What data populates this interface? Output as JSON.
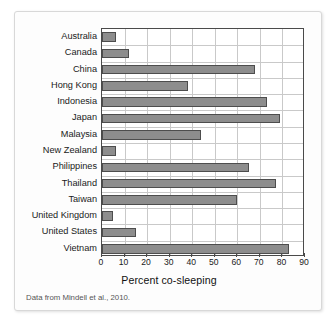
{
  "figure": {
    "axis_title": "Percent co-sleeping",
    "source_note": "Data from Mindell et al., 2010."
  },
  "colors": {
    "bar_fill": "#8d8d8d",
    "bar_border": "#4d4d4d",
    "gridline": "#c9c9c9",
    "axis": "#4a4a4a",
    "card_background": "#fdfdfd"
  },
  "chart_data": {
    "type": "bar",
    "orientation": "horizontal",
    "title": "",
    "xlabel": "Percent co-sleeping",
    "ylabel": "",
    "xlim": [
      0,
      90
    ],
    "xticks": [
      0,
      10,
      20,
      30,
      40,
      50,
      60,
      70,
      80,
      90
    ],
    "grid": true,
    "legend": false,
    "categories": [
      "Australia",
      "Canada",
      "China",
      "Hong Kong",
      "Indonesia",
      "Japan",
      "Malaysia",
      "New Zealand",
      "Philippines",
      "Thailand",
      "Taiwan",
      "United Kingdom",
      "United States",
      "Vietnam"
    ],
    "values": [
      6,
      12,
      68,
      38,
      73,
      79,
      44,
      6,
      65,
      77,
      60,
      5,
      15,
      83
    ],
    "annotations": [
      "Data from Mindell et al., 2010."
    ]
  }
}
